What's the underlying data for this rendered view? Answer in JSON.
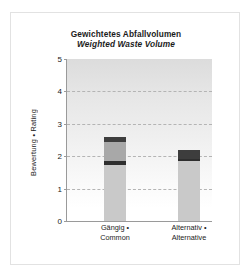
{
  "chart_data": {
    "type": "bar",
    "stacked": true,
    "title": "Gewichtetes Abfallvolumen",
    "subtitle": "Weighted Waste Volume",
    "xlabel": "",
    "ylabel": "Bewertung • Rating",
    "ylim": [
      0,
      5
    ],
    "yticks": [
      0,
      1,
      2,
      3,
      4,
      5
    ],
    "ytick_labels": [
      "0",
      "1",
      "2",
      "3",
      "4",
      "5"
    ],
    "grid": "horizontal-dashed",
    "legend": "none",
    "categories": [
      "Gängig • Common",
      "Alternativ • Alternative"
    ],
    "category_lines": [
      [
        "Gängig •",
        "Common"
      ],
      [
        "Alternativ •",
        "Alternative"
      ]
    ],
    "totals": [
      2.6,
      2.2
    ],
    "series": [
      {
        "name": "segment-1",
        "color": "#c9c9c9",
        "values": [
          1.72,
          1.85
        ]
      },
      {
        "name": "segment-2",
        "color": "#2e2e2e",
        "values": [
          0.13,
          0.05
        ]
      },
      {
        "name": "segment-3",
        "color": "#a8a8a8",
        "values": [
          0.6,
          0.0
        ]
      },
      {
        "name": "segment-4",
        "color": "#3d3d3d",
        "values": [
          0.15,
          0.3
        ]
      }
    ],
    "bars": [
      {
        "category": "Gängig • Common",
        "total": 2.6,
        "segments": [
          {
            "name": "segment-1",
            "from": 0.0,
            "to": 1.72,
            "color": "#c9c9c9"
          },
          {
            "name": "segment-2",
            "from": 1.72,
            "to": 1.85,
            "color": "#2e2e2e"
          },
          {
            "name": "segment-3",
            "from": 1.85,
            "to": 2.45,
            "color": "#a8a8a8"
          },
          {
            "name": "segment-4",
            "from": 2.45,
            "to": 2.6,
            "color": "#3d3d3d"
          }
        ]
      },
      {
        "category": "Alternativ • Alternative",
        "total": 2.2,
        "segments": [
          {
            "name": "segment-1",
            "from": 0.0,
            "to": 1.85,
            "color": "#c9c9c9"
          },
          {
            "name": "segment-2",
            "from": 1.85,
            "to": 1.9,
            "color": "#2e2e2e"
          },
          {
            "name": "segment-4",
            "from": 1.9,
            "to": 2.2,
            "color": "#3d3d3d"
          }
        ]
      }
    ]
  },
  "colors": {
    "frame": "#e2e2e2",
    "axis": "#9a9a9a",
    "grid": "#b4b4b4",
    "text": "#1b1b1b",
    "plot_bg_top": "#dcdcdc",
    "plot_bg_bottom": "#ffffff"
  }
}
